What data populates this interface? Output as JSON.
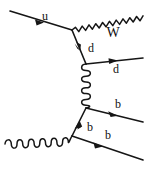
{
  "figure": {
    "kind": "feynman-diagram",
    "title": "",
    "background_color": "#ffffff",
    "line_color": "#161616",
    "width": 144,
    "height": 182
  },
  "labels": {
    "incoming_up_quark": "u",
    "w_boson": "W",
    "internal_down_quark": "d",
    "outgoing_down_quark": "d",
    "outgoing_b_quark_upper": "b",
    "internal_b_quark": "b",
    "outgoing_b_quark_lower": "b"
  },
  "particles": [
    {
      "id": "incoming-up-quark",
      "label": "u",
      "type": "fermion",
      "style": "straight-with-arrow",
      "role": "incoming",
      "direction": "right-down"
    },
    {
      "id": "w-boson",
      "label": "W",
      "type": "boson",
      "style": "wavy",
      "role": "outgoing",
      "direction": "right-up"
    },
    {
      "id": "internal-down-quark",
      "label": "d",
      "type": "fermion",
      "style": "straight-with-arrow",
      "role": "internal",
      "direction": "down-right"
    },
    {
      "id": "outgoing-down-quark",
      "label": "d",
      "type": "fermion",
      "style": "straight-with-arrow",
      "role": "outgoing",
      "direction": "right"
    },
    {
      "id": "gluon-propagator",
      "label": "",
      "type": "gluon",
      "style": "coil",
      "role": "internal",
      "direction": "vertical"
    },
    {
      "id": "outgoing-b-quark-upper",
      "label": "b",
      "type": "fermion",
      "style": "straight-with-arrow",
      "role": "outgoing",
      "direction": "right-down"
    },
    {
      "id": "internal-b-quark",
      "label": "b",
      "type": "fermion",
      "style": "straight-with-arrow",
      "role": "internal",
      "direction": "up-right"
    },
    {
      "id": "incoming-gluon",
      "label": "",
      "type": "gluon",
      "style": "coil",
      "role": "incoming",
      "direction": "right"
    },
    {
      "id": "outgoing-b-quark-lower",
      "label": "b",
      "type": "fermion",
      "style": "straight-with-arrow",
      "role": "outgoing",
      "direction": "right-down"
    }
  ],
  "vertices": [
    {
      "id": "vertex-u-d-w",
      "x": 72,
      "y": 30
    },
    {
      "id": "vertex-d-gluon",
      "x": 86,
      "y": 64
    },
    {
      "id": "vertex-gluon-b",
      "x": 86,
      "y": 108
    },
    {
      "id": "vertex-gluon-in-b",
      "x": 72,
      "y": 136
    }
  ]
}
